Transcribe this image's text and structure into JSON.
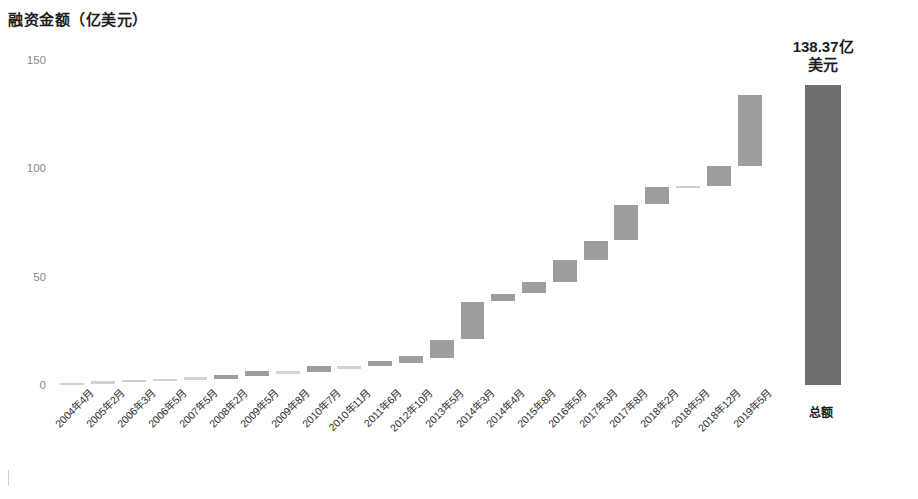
{
  "chart_data": {
    "type": "bar",
    "subtype": "waterfall",
    "title": "融资金额（亿美元）",
    "xlabel": "",
    "ylabel": "融资金额（亿美元）",
    "ylim": [
      0,
      150
    ],
    "yticks": [
      0,
      50,
      100,
      150
    ],
    "ytick_labels": [
      "0",
      "50",
      "100",
      "150"
    ],
    "grid": false,
    "legend": null,
    "bar_color": "#9d9d9d",
    "total_bar_color": "#6e6e6e",
    "categories": [
      "2004年4月",
      "2005年2月",
      "2006年3月",
      "2006年5月",
      "2007年5月",
      "2008年2月",
      "2009年5月",
      "2009年8月",
      "2010年7月",
      "2010年11月",
      "2011年6月",
      "2012年10月",
      "2013年5月",
      "2014年3月",
      "2014年4月",
      "2015年8月",
      "2016年5月",
      "2017年3月",
      "2017年8月",
      "2018年2月",
      "2018年5月",
      "2018年12月",
      "2019年5月",
      "总额"
    ],
    "increments": [
      0.12,
      0.25,
      0.3,
      0.4,
      0.5,
      1.1,
      1.5,
      0.6,
      1.2,
      0.9,
      1.5,
      2.0,
      9.0,
      11.0,
      3.0,
      4.5,
      8.5,
      6.0,
      7.5,
      3.5,
      1.0,
      4.5,
      25.0
    ],
    "cumulative_start": [
      0.0,
      0.12,
      0.37,
      0.67,
      1.07,
      1.57,
      2.67,
      4.17,
      4.77,
      5.97,
      6.87,
      8.37,
      10.37,
      19.37,
      30.37,
      33.37,
      37.87,
      46.37,
      52.37,
      59.87,
      63.37,
      64.37,
      68.87
    ],
    "cumulative_end": [
      0.12,
      0.37,
      0.67,
      1.07,
      1.57,
      2.67,
      4.17,
      4.77,
      5.97,
      6.87,
      8.37,
      10.37,
      19.37,
      30.37,
      33.37,
      37.87,
      46.37,
      52.37,
      59.87,
      63.37,
      64.37,
      68.87,
      93.87
    ],
    "total_label_name": "总额",
    "total_value": 138.37,
    "annotations": [
      {
        "text_line1": "138.37亿",
        "text_line2": "美元",
        "target": "总额"
      }
    ]
  },
  "bars": [
    {
      "label": "2004年4月",
      "left_pct": 0.4,
      "width_pct": 2.8,
      "top_val": 1.0,
      "bottom_val": 0.0,
      "faint": true
    },
    {
      "label": "2005年2月",
      "left_pct": 4.0,
      "width_pct": 2.8,
      "top_val": 1.8,
      "bottom_val": 0.6,
      "faint": true
    },
    {
      "label": "2006年3月",
      "left_pct": 7.6,
      "width_pct": 2.8,
      "top_val": 2.4,
      "bottom_val": 1.3,
      "faint": true
    },
    {
      "label": "2006年5月",
      "left_pct": 11.2,
      "width_pct": 2.8,
      "top_val": 2.9,
      "bottom_val": 1.8,
      "faint": true
    },
    {
      "label": "2007年5月",
      "left_pct": 14.8,
      "width_pct": 2.8,
      "top_val": 3.6,
      "bottom_val": 2.4,
      "faint": true
    },
    {
      "label": "2008年2月",
      "left_pct": 18.4,
      "width_pct": 2.8,
      "top_val": 4.6,
      "bottom_val": 2.8,
      "faint": false
    },
    {
      "label": "2009年5月",
      "left_pct": 22.0,
      "width_pct": 2.8,
      "top_val": 6.3,
      "bottom_val": 4.0,
      "faint": false
    },
    {
      "label": "2009年8月",
      "left_pct": 25.6,
      "width_pct": 2.8,
      "top_val": 6.6,
      "bottom_val": 5.2,
      "faint": true
    },
    {
      "label": "2010年7月",
      "left_pct": 29.2,
      "width_pct": 2.8,
      "top_val": 8.6,
      "bottom_val": 6.2,
      "faint": false
    },
    {
      "label": "2010年11月",
      "left_pct": 32.8,
      "width_pct": 2.8,
      "top_val": 9.0,
      "bottom_val": 7.6,
      "faint": true
    },
    {
      "label": "2011年6月",
      "left_pct": 36.4,
      "width_pct": 2.8,
      "top_val": 11.2,
      "bottom_val": 8.6,
      "faint": false
    },
    {
      "label": "2012年10月",
      "left_pct": 40.0,
      "width_pct": 2.8,
      "top_val": 13.3,
      "bottom_val": 10.3,
      "faint": false
    },
    {
      "label": "2013年5月",
      "left_pct": 43.6,
      "width_pct": 2.8,
      "top_val": 21.0,
      "bottom_val": 12.4,
      "faint": false
    },
    {
      "label": "2014年3月",
      "left_pct": 47.2,
      "width_pct": 2.8,
      "top_val": 38.5,
      "bottom_val": 21.0,
      "faint": false
    },
    {
      "label": "2014年4月",
      "left_pct": 50.8,
      "width_pct": 2.8,
      "top_val": 42.0,
      "bottom_val": 39.0,
      "faint": false
    },
    {
      "label": "2015年8月",
      "left_pct": 54.4,
      "width_pct": 2.8,
      "top_val": 47.5,
      "bottom_val": 42.5,
      "faint": false
    },
    {
      "label": "2016年5月",
      "left_pct": 58.0,
      "width_pct": 2.8,
      "top_val": 57.5,
      "bottom_val": 47.5,
      "faint": false
    },
    {
      "label": "2017年3月",
      "left_pct": 61.6,
      "width_pct": 2.8,
      "top_val": 66.5,
      "bottom_val": 57.5,
      "faint": false
    },
    {
      "label": "2017年8月",
      "left_pct": 65.2,
      "width_pct": 2.8,
      "top_val": 83.0,
      "bottom_val": 67.0,
      "faint": false
    },
    {
      "label": "2018年2月",
      "left_pct": 68.8,
      "width_pct": 2.8,
      "top_val": 91.5,
      "bottom_val": 83.5,
      "faint": false
    },
    {
      "label": "2018年5月",
      "left_pct": 72.4,
      "width_pct": 2.8,
      "top_val": 92.0,
      "bottom_val": 91.0,
      "faint": true
    },
    {
      "label": "2018年12月",
      "left_pct": 76.0,
      "width_pct": 2.8,
      "top_val": 101.0,
      "bottom_val": 92.0,
      "faint": false
    },
    {
      "label": "2019年5月",
      "left_pct": 79.6,
      "width_pct": 2.8,
      "top_val": 134.0,
      "bottom_val": 101.0,
      "faint": false
    },
    {
      "label": "总额",
      "left_pct": 87.5,
      "width_pct": 4.2,
      "top_val": 138.37,
      "bottom_val": 0.0,
      "total": true
    }
  ]
}
